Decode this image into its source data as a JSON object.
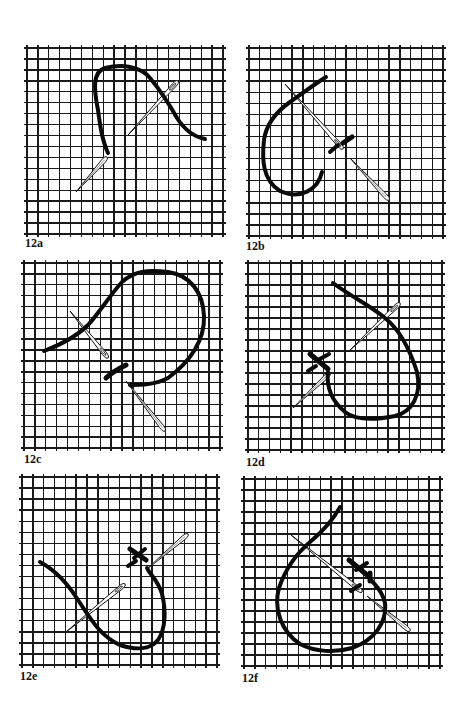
{
  "figure": {
    "grid_color": "#1a1a1a",
    "thread_color": "#0a0a0a",
    "needle_fill": "#ffffff",
    "needle_stroke": "#111111",
    "panels": [
      {
        "id": "12a",
        "label": "12a",
        "grid": {
          "x": 27,
          "y": 48,
          "w": 196,
          "h": 186,
          "cols": 18,
          "rows": 17
        },
        "label_pos": {
          "x": 25,
          "y": 237
        },
        "threads": [
          {
            "d": "M 108 153 C 102 140, 100 125, 98 110 C 94 90, 92 72, 105 68 C 122 64, 140 66, 150 78 C 160 90, 168 102, 177 118 C 186 132, 195 137, 205 139",
            "w": 4
          }
        ],
        "needles": [
          {
            "x1": 76,
            "y1": 192,
            "x2": 107,
            "y2": 157,
            "eye": false
          },
          {
            "x1": 128,
            "y1": 135,
            "x2": 178,
            "y2": 81,
            "eye": true
          }
        ],
        "bars": []
      },
      {
        "id": "12b",
        "label": "12b",
        "grid": {
          "x": 249,
          "y": 48,
          "w": 194,
          "h": 188,
          "cols": 18,
          "rows": 17
        },
        "label_pos": {
          "x": 246,
          "y": 240
        },
        "threads": [
          {
            "d": "M 326 77 C 312 86, 300 95, 290 102 C 276 112, 266 125, 264 140 C 262 158, 262 180, 280 191 C 300 200, 318 190, 322 172",
            "w": 4
          },
          {
            "d": "M 330 152 L 338 145",
            "w": 4
          },
          {
            "d": "M 343 143 L 352 137",
            "w": 5
          }
        ],
        "needles": [
          {
            "x1": 285,
            "y1": 84,
            "x2": 343,
            "y2": 149,
            "eye": true
          },
          {
            "x1": 350,
            "y1": 158,
            "x2": 389,
            "y2": 200,
            "eye": false
          }
        ],
        "bars": []
      },
      {
        "id": "12c",
        "label": "12c",
        "grid": {
          "x": 24,
          "y": 263,
          "w": 196,
          "h": 185,
          "cols": 18,
          "rows": 17
        },
        "label_pos": {
          "x": 24,
          "y": 453
        },
        "threads": [
          {
            "d": "M 44 351 C 60 345, 75 338, 88 325 C 100 312, 110 295, 122 282 C 135 270, 150 270, 168 272 C 190 275, 203 292, 204 316 C 205 340, 190 362, 168 378 C 155 385, 140 385, 130 385",
            "w": 4
          },
          {
            "d": "M 106 378 C 112 372, 118 369, 126 365",
            "w": 5
          }
        ],
        "needles": [
          {
            "x1": 70,
            "y1": 311,
            "x2": 108,
            "y2": 358,
            "eye": true
          },
          {
            "x1": 126,
            "y1": 381,
            "x2": 165,
            "y2": 431,
            "eye": false
          }
        ],
        "bars": []
      },
      {
        "id": "12d",
        "label": "12d",
        "grid": {
          "x": 248,
          "y": 263,
          "w": 194,
          "h": 187,
          "cols": 18,
          "rows": 17
        },
        "label_pos": {
          "x": 246,
          "y": 456
        },
        "threads": [
          {
            "d": "M 333 283 C 350 296, 370 305, 385 318 C 400 330, 410 350, 417 372 C 422 395, 412 412, 395 416 C 375 420, 355 420, 345 412 C 333 402, 326 390, 328 372",
            "w": 4
          }
        ],
        "needles": [
          {
            "x1": 293,
            "y1": 408,
            "x2": 330,
            "y2": 373,
            "eye": false
          },
          {
            "x1": 348,
            "y1": 352,
            "x2": 400,
            "y2": 303,
            "eye": true
          }
        ],
        "bars": [
          {
            "x1": 310,
            "y1": 354,
            "x2": 328,
            "y2": 369,
            "w": 5
          },
          {
            "x1": 318,
            "y1": 360,
            "x2": 329,
            "y2": 354,
            "w": 4
          },
          {
            "x1": 308,
            "y1": 371,
            "x2": 316,
            "y2": 366,
            "w": 4
          }
        ]
      },
      {
        "id": "12e",
        "label": "12e",
        "grid": {
          "x": 22,
          "y": 477,
          "w": 195,
          "h": 188,
          "cols": 18,
          "rows": 17
        },
        "label_pos": {
          "x": 20,
          "y": 670
        },
        "threads": [
          {
            "d": "M 40 562 C 55 570, 68 584, 78 600 C 90 618, 100 636, 120 645 C 135 650, 150 650, 158 640 C 166 628, 166 610, 162 594 C 158 580, 150 575, 147 568",
            "w": 4
          }
        ],
        "needles": [
          {
            "x1": 66,
            "y1": 632,
            "x2": 125,
            "y2": 584,
            "eye": true
          },
          {
            "x1": 147,
            "y1": 569,
            "x2": 188,
            "y2": 534,
            "eye": false
          }
        ],
        "bars": [
          {
            "x1": 130,
            "y1": 549,
            "x2": 146,
            "y2": 560,
            "w": 5
          },
          {
            "x1": 134,
            "y1": 558,
            "x2": 145,
            "y2": 549,
            "w": 4
          },
          {
            "x1": 128,
            "y1": 566,
            "x2": 136,
            "y2": 561,
            "w": 4
          }
        ]
      },
      {
        "id": "12f",
        "label": "12f",
        "grid": {
          "x": 244,
          "y": 479,
          "w": 196,
          "h": 187,
          "cols": 18,
          "rows": 17
        },
        "label_pos": {
          "x": 242,
          "y": 672
        },
        "threads": [
          {
            "d": "M 340 507 C 332 522, 322 532, 310 542 C 295 555, 285 570, 279 588 C 273 610, 282 632, 300 644 C 315 652, 335 653, 352 648 C 375 640, 387 622, 385 603 C 382 590, 375 585, 371 580",
            "w": 4
          },
          {
            "d": "M 370 581 L 370 573",
            "w": 5
          }
        ],
        "needles": [
          {
            "x1": 291,
            "y1": 535,
            "x2": 362,
            "y2": 592,
            "eye": true
          },
          {
            "x1": 367,
            "y1": 596,
            "x2": 410,
            "y2": 631,
            "eye": false
          }
        ],
        "bars": [
          {
            "x1": 349,
            "y1": 560,
            "x2": 367,
            "y2": 575,
            "w": 5
          },
          {
            "x1": 356,
            "y1": 570,
            "x2": 367,
            "y2": 563,
            "w": 4
          },
          {
            "x1": 351,
            "y1": 591,
            "x2": 360,
            "y2": 585,
            "w": 4
          }
        ]
      }
    ]
  }
}
